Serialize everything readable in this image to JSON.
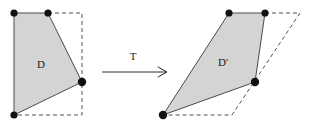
{
  "figure": {
    "type": "geometric-transformation-diagram",
    "canvas": {
      "width": 312,
      "height": 128,
      "background": "#ffffff"
    },
    "colors": {
      "region_fill": "#d4d4d4",
      "region_stroke": "#4a4a4a",
      "dashed_stroke": "#555555",
      "vertex_dot": "#111111",
      "arrow": "#2b2b2b",
      "label_text": "#1a1a1a"
    },
    "labels": {
      "source_region": "D",
      "target_region": "D'",
      "transformation": "T"
    },
    "label_positions": {
      "source_region": {
        "x": 41,
        "y": 65
      },
      "target_region": {
        "x": 223,
        "y": 63
      },
      "transformation": {
        "x": 133,
        "y": 57
      }
    },
    "source": {
      "name": "D",
      "polygon_points": "14,13 48,13 82,82 14,115",
      "vertices": [
        {
          "x": 14,
          "y": 13
        },
        {
          "x": 48,
          "y": 13
        },
        {
          "x": 82,
          "y": 82
        },
        {
          "x": 14,
          "y": 115
        }
      ],
      "dashed_guide_points": "48,13 82,13 82,115 14,115",
      "guide_shape": "rectangle",
      "guide_corners": [
        {
          "x": 14,
          "y": 13
        },
        {
          "x": 82,
          "y": 13
        },
        {
          "x": 82,
          "y": 115
        },
        {
          "x": 14,
          "y": 115
        }
      ]
    },
    "target": {
      "name": "D'",
      "polygon_points": "229,13 265,13 255,82 163,115",
      "vertices": [
        {
          "x": 229,
          "y": 13
        },
        {
          "x": 265,
          "y": 13
        },
        {
          "x": 255,
          "y": 82
        },
        {
          "x": 163,
          "y": 115
        }
      ],
      "dashed_guide_points": "265,13 300,13 232,115 163,115",
      "guide_shape": "parallelogram",
      "guide_corners": [
        {
          "x": 229,
          "y": 13
        },
        {
          "x": 300,
          "y": 13
        },
        {
          "x": 232,
          "y": 115
        },
        {
          "x": 163,
          "y": 115
        }
      ]
    },
    "arrow": {
      "shaft_start": {
        "x": 102,
        "y": 72
      },
      "shaft_end": {
        "x": 166,
        "y": 72
      },
      "head_points": "158,67 167,72 158,77",
      "icon": "right-arrow-icon"
    },
    "vertex_radius": 3.6
  }
}
